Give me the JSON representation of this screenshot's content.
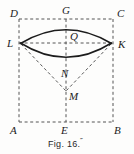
{
  "figure": {
    "caption": "Fig. 16.",
    "caption_suffix": "˝",
    "background_color": "#fdfdfc",
    "ink_color": "#1c1c1c",
    "dash_color": "#555555",
    "width": 134,
    "height": 154
  },
  "labels": {
    "D": "D",
    "G": "G",
    "C": "C",
    "L": "L",
    "Q": "Q",
    "K": "K",
    "N": "N",
    "M": "M",
    "A": "A",
    "E": "E",
    "B": "B"
  },
  "points": {
    "D": {
      "x": 19,
      "y": 19,
      "label_x": 10,
      "label_y": 17
    },
    "G": {
      "x": 66,
      "y": 19,
      "label_x": 62,
      "label_y": 14
    },
    "C": {
      "x": 113,
      "y": 19,
      "label_x": 117,
      "label_y": 17
    },
    "L": {
      "x": 19,
      "y": 43,
      "label_x": 8,
      "label_y": 47
    },
    "Q": {
      "x": 66,
      "y": 43,
      "label_x": 70,
      "label_y": 40
    },
    "K": {
      "x": 113,
      "y": 43,
      "label_x": 118,
      "label_y": 48
    },
    "N": {
      "x": 66,
      "y": 64,
      "label_x": 62,
      "label_y": 76
    },
    "M": {
      "x": 66,
      "y": 91,
      "label_x": 69,
      "label_y": 100
    },
    "A": {
      "x": 19,
      "y": 122,
      "label_x": 10,
      "label_y": 134
    },
    "E": {
      "x": 66,
      "y": 122,
      "label_x": 62,
      "label_y": 134
    },
    "B": {
      "x": 113,
      "y": 122,
      "label_x": 115,
      "label_y": 134
    }
  },
  "segments": {
    "rect_top": {
      "name": "DC",
      "style": "dashed"
    },
    "rect_bottom": {
      "name": "AB",
      "style": "dashed"
    },
    "rect_left": {
      "name": "DA",
      "style": "dashed"
    },
    "rect_right": {
      "name": "CB",
      "style": "dashed"
    },
    "horizontal_LK": {
      "name": "LK",
      "style": "dashed"
    },
    "vertical_GE": {
      "name": "GE",
      "style": "dashed"
    },
    "chord_LM": {
      "name": "LM",
      "style": "dashed"
    },
    "chord_KM": {
      "name": "KM",
      "style": "dashed"
    }
  },
  "arcs": {
    "upper": {
      "name": "LGK",
      "style": "solid",
      "through": "G"
    },
    "lower": {
      "name": "LNK",
      "style": "solid",
      "through": "N"
    }
  }
}
